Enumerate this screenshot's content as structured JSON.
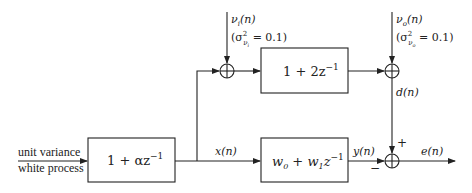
{
  "diagram": {
    "type": "block-diagram",
    "input": {
      "line1": "unit variance",
      "line2": "white process"
    },
    "blocks": [
      {
        "id": "shaping-filter",
        "label": "1 + αz",
        "sup": "−1"
      },
      {
        "id": "unknown-system",
        "label": "1 + 2z",
        "sup": "−1"
      },
      {
        "id": "adaptive-filter",
        "label_w0": "w",
        "sub0": "0",
        "plus": " + ",
        "label_w1": "w",
        "sub1": "1",
        "z": "z",
        "sup": "−1"
      }
    ],
    "noise_inputs": [
      {
        "id": "input-noise",
        "name": "ν",
        "sub": "i",
        "arg": "(n)",
        "variance_prefix": "(σ",
        "variance_sup": "2",
        "variance_sub": "ν",
        "variance_subsub": "i",
        "variance_suffix": " = 0.1)"
      },
      {
        "id": "output-noise",
        "name": "ν",
        "sub": "o",
        "arg": "(n)",
        "variance_prefix": "(σ",
        "variance_sup": "2",
        "variance_sub": "ν",
        "variance_subsub": "o",
        "variance_suffix": " = 0.1)"
      }
    ],
    "signals": {
      "x": "x(n)",
      "y": "y(n)",
      "d": "d(n)",
      "e": "e(n)"
    },
    "signs": {
      "plus": "+",
      "minus": "−"
    },
    "summer_symbol": "⊕",
    "colors": {
      "line": "#222222",
      "background": "#ffffff"
    }
  }
}
